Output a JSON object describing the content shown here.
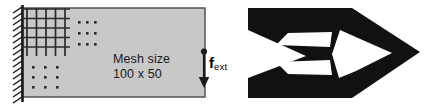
{
  "figure": {
    "width": 433,
    "height": 110,
    "background": "#ffffff"
  },
  "left_panel": {
    "name": "cantilever-design-domain",
    "domain_rect": {
      "x": 22,
      "y": 8,
      "width": 183,
      "height": 89,
      "fill": "#c8c8c8",
      "stroke": "#4a4a4a"
    },
    "support": {
      "name": "fixed-support-hatching",
      "x": 22,
      "y": 6,
      "height": 96,
      "hatch_count": 17,
      "color": "#1a1a1a"
    },
    "mesh": {
      "name": "finite-element-mesh",
      "color": "#2b2b2b",
      "origin_x": 22,
      "origin_y": 8,
      "cell": 9.5,
      "cols": 5,
      "rows": 5,
      "dot_color": "#2b2b2b",
      "dot_rows_right": 3,
      "dot_cols_right": 3,
      "dot_rows_bottom": 3,
      "dot_cols_bottom": 3
    },
    "mesh_label": {
      "line1": "Mesh size",
      "line2": "100 x 50"
    },
    "force": {
      "label_symbol": "f",
      "label_subscript": "ext",
      "arrow_x": 204,
      "arrow_top": 50,
      "arrow_bottom": 88,
      "color": "#1a1a1a"
    }
  },
  "right_panel": {
    "name": "optimized-topology-result",
    "material_color": "#111111",
    "void_color": "#ffffff",
    "description": "Optimized cantilever beam topology"
  }
}
